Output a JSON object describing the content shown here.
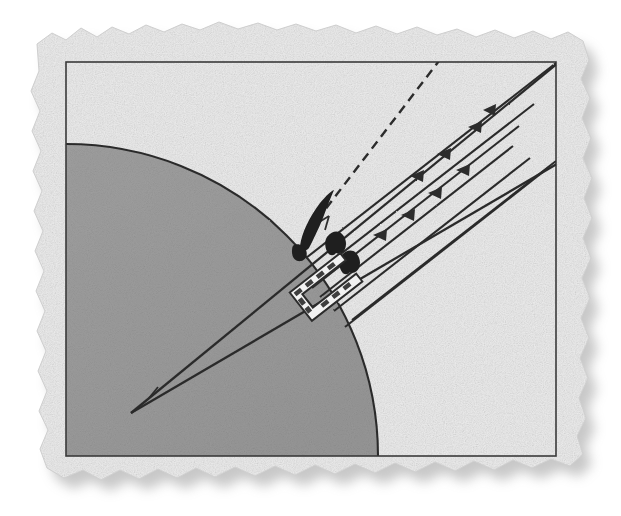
{
  "figure": {
    "title": "Scanned technical illustration on torn-edge paper",
    "medium": "scanned-paper-scan",
    "canvas": {
      "width": 621,
      "height": 516
    },
    "colors": {
      "page_background": "#ffffff",
      "paper_light": "#efefef",
      "paper_mid": "#e2e2e2",
      "paper_dark": "#d2d2d2",
      "shaded_region_fill": "#9b9b9b",
      "shaded_region_fill_dark": "#8e8e8e",
      "ink": "#2c2c2c",
      "ink_soft": "#3a3a3a",
      "drop_shadow": "#b4b4b4",
      "bracket_fill": "#f2f2f2"
    },
    "paper": {
      "name": "torn-edge-paper-sheet",
      "x": 28,
      "y": 22,
      "width": 560,
      "height": 458,
      "edge_style": "deckle-torn",
      "shadow_offset_x": 8,
      "shadow_offset_y": 10,
      "shadow_blur": 9
    },
    "frame": {
      "name": "inner-border-rectangle",
      "x": 66,
      "y": 62,
      "width": 490,
      "height": 394,
      "stroke_width": 1.6
    },
    "shaded_region": {
      "name": "quarter-circle-shaded-field",
      "shape": "circle-sector-clipped-to-frame",
      "center_x": 66,
      "center_y": 456,
      "radius": 312,
      "description": "Large gray quarter-disc anchored at lower-left of the frame, arc rising from the left border up across to the bottom border"
    },
    "cone": {
      "name": "converging-wedge-cone",
      "apex_x": 131,
      "apex_y": 413,
      "upper_edge_end_x": 559,
      "upper_edge_end_y": 62,
      "lower_edge_end_x": 562,
      "lower_edge_end_y": 161,
      "tick_mark": {
        "x": 156,
        "y": 394,
        "length": 13
      },
      "description": "Narrow wedge opening from a sharp apex at lower-left toward upper-right"
    },
    "dashed_line": {
      "name": "dashed-reference-axis",
      "x1": 308,
      "y1": 232,
      "x2": 442,
      "y2": 57,
      "dash": "9 6",
      "angle_tick": {
        "x": 320,
        "y": 218,
        "length": 12
      }
    },
    "ray_lines": {
      "name": "parallel-incident-rays",
      "count": 7,
      "direction": "down-left",
      "arrow_marks": 8,
      "angle_degrees": -38,
      "description": "Family of parallel straight rays entering from upper right, each terminating in a staircase along the right frame edge, several carrying small solid arrowheads"
    },
    "dark_blobs": {
      "name": "solid-ink-marks",
      "count": 3,
      "description": "Solid black irregular marks at the convergence point and along the first two ray channels"
    },
    "bracket": {
      "name": "u-shaped-clamp-bracket",
      "x": 296,
      "y": 262,
      "width": 62,
      "height": 46,
      "rotation_degrees": -38,
      "description": "Small open rectangular bracket (U clamp) outlined in ink with light fill, attached at the lower end of the ray bundle"
    }
  }
}
